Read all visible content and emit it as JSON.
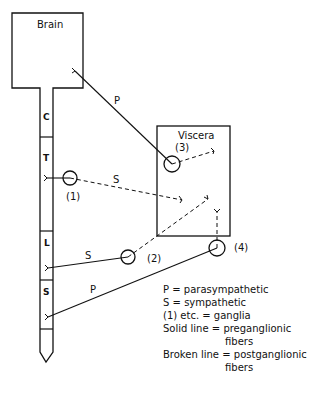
{
  "diagram": {
    "nodes": {
      "brain": {
        "label": "Brain"
      },
      "viscera": {
        "label": "Viscera"
      },
      "spinal_segments": [
        {
          "label": "C"
        },
        {
          "label": "T"
        },
        {
          "label": "L"
        },
        {
          "label": "S"
        }
      ],
      "ganglia": [
        {
          "label": "(1)"
        },
        {
          "label": "(2)"
        },
        {
          "label": "(3)"
        },
        {
          "label": "(4)"
        }
      ]
    },
    "fiber_labels": {
      "brain_to_g3": "P",
      "g1_to_viscera": "S",
      "l_to_g2": "S",
      "s_to_g4": "P"
    },
    "colors": {
      "line": "#111111",
      "background": "#ffffff"
    }
  },
  "legend": {
    "items": [
      {
        "key": "P",
        "eq": "=",
        "value": "parasympathetic"
      },
      {
        "key": "S",
        "eq": "=",
        "value": "sympathetic"
      },
      {
        "key": "(1) etc.",
        "eq": "=",
        "value": "ganglia"
      },
      {
        "key": "Solid line",
        "eq": "=",
        "value": "preganglionic",
        "value2": "fibers"
      },
      {
        "key": "Broken line",
        "eq": "=",
        "value": "postganglionic",
        "value2": "fibers"
      }
    ]
  }
}
